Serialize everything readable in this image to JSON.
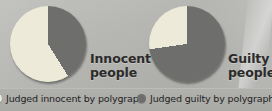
{
  "figure": {
    "background_color": "#b6b6b3",
    "legend_band_color": "#aaaaa7"
  },
  "chart_data": {
    "type": "pie",
    "title": "",
    "subtitle": "",
    "xlabel": "",
    "ylabel": "",
    "legend_position": "bottom",
    "grid": false,
    "colors": {
      "judged_innocent": "#eeead9",
      "judged_guilty": "#6e6e6c"
    },
    "charts": [
      {
        "name": "innocent-people",
        "label_line1": "Innocent",
        "label_line2": "people",
        "categories": [
          "Judged guilty by polygraph",
          "Judged innocent by polygraph"
        ],
        "values": [
          41,
          59
        ],
        "start_angle_deg": 0,
        "slices": [
          {
            "category": "Judged guilty by polygraph",
            "value": 41,
            "color": "#6e6e6c",
            "sweep_deg": 148
          },
          {
            "category": "Judged innocent by polygraph",
            "value": 59,
            "color": "#eeead9",
            "sweep_deg": 212
          }
        ]
      },
      {
        "name": "guilty-people",
        "label_line1": "Guilty",
        "label_line2": "people",
        "categories": [
          "Judged guilty by polygraph",
          "Judged innocent by polygraph"
        ],
        "values": [
          73,
          27
        ],
        "start_angle_deg": 0,
        "slices": [
          {
            "category": "Judged guilty by polygraph",
            "value": 73,
            "color": "#6e6e6c",
            "sweep_deg": 262
          },
          {
            "category": "Judged innocent by polygraph",
            "value": 27,
            "color": "#eeead9",
            "sweep_deg": 98
          }
        ]
      }
    ],
    "legend": [
      {
        "label": "Judged innocent by polygraph",
        "color": "#eeead9"
      },
      {
        "label": "Judged guilty by polygraph",
        "color": "#6e6e6c"
      }
    ]
  }
}
